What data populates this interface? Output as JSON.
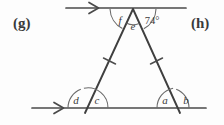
{
  "figure": {
    "part_labels": [
      {
        "name": "part-label-g",
        "text": "(g)"
      },
      {
        "name": "part-label-h",
        "text": "(h)"
      }
    ],
    "angle_labels": {
      "apex_left_exterior": "f",
      "apex_interior": "e",
      "apex_right_exterior": "74°",
      "base_left_exterior": "d",
      "base_left_interior": "c",
      "base_right_interior": "a",
      "base_right_exterior": "b"
    },
    "given_angle_value": "74°",
    "colors": {
      "background": "#fdfdfd",
      "line": "#4a4a4a",
      "leg": "#3f3f3f",
      "arc": "#6a6a6a",
      "text": "#3b3b3b"
    },
    "geometry": {
      "top_line": {
        "x1": 66,
        "y1": 8,
        "x2": 186,
        "y2": 8
      },
      "bottom_line": {
        "x1": 32,
        "y1": 108,
        "x2": 206,
        "y2": 108
      },
      "apex": {
        "x": 133,
        "y": 9
      },
      "base_left": {
        "x": 88,
        "y": 108
      },
      "base_right": {
        "x": 177,
        "y": 108
      },
      "tick_marks": 2,
      "arrow_markers": 2
    }
  }
}
